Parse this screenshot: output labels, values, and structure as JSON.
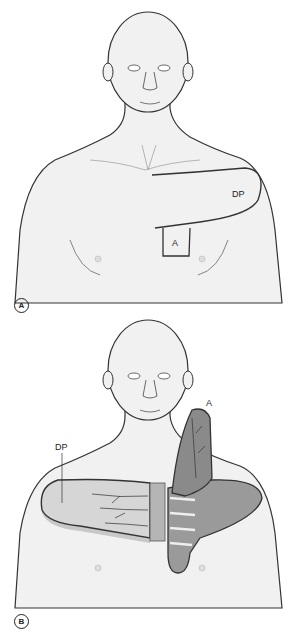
{
  "figure": {
    "panels": [
      {
        "id": "A",
        "letter": "A",
        "labels": {
          "flap": "DP",
          "donor": "A"
        },
        "description": "Anterior torso with outline of deltopectoral flap (DP) and square area A"
      },
      {
        "id": "B",
        "letter": "B",
        "labels": {
          "flap": "DP",
          "donor": "A"
        },
        "description": "Deltopectoral flap raised and reflected medially; flap A elevated showing underlying muscle"
      }
    ],
    "colors": {
      "skin": "#f1f1f1",
      "outline": "#333333",
      "flap_fill": "#d6d6d6",
      "muscle": "#8f8f8f",
      "muscle_dark": "#6e6e6e",
      "shadow": "#c8c8c8"
    }
  }
}
